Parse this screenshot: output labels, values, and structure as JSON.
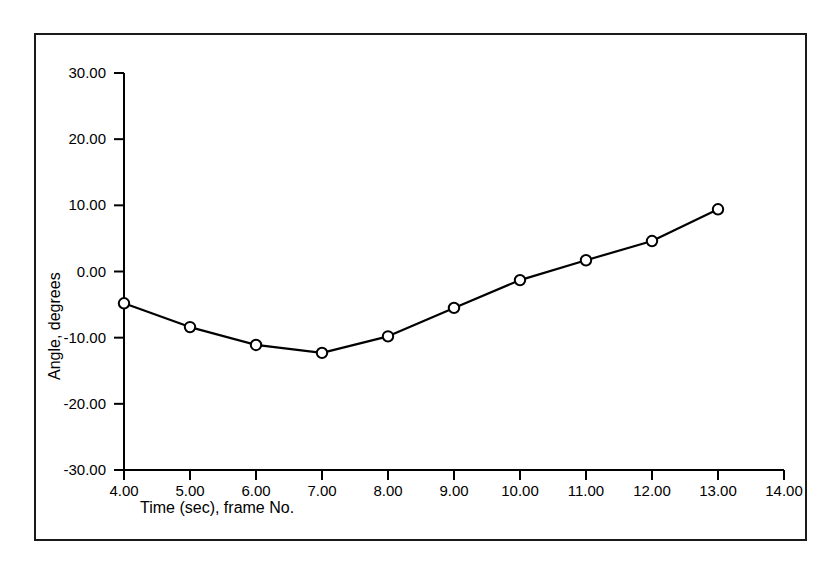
{
  "figure": {
    "border_color": "#1a1a1a",
    "background": "#ffffff",
    "line_color": "#000000",
    "marker_fill": "#ffffff"
  },
  "chart_data": {
    "type": "line",
    "title": "",
    "xlabel": "Time (sec), frame  No.",
    "ylabel": "Angle, degrees",
    "xlim": [
      4.0,
      14.0
    ],
    "ylim": [
      -30.0,
      30.0
    ],
    "grid": false,
    "legend": "none",
    "xticks": [
      4.0,
      5.0,
      6.0,
      7.0,
      8.0,
      9.0,
      10.0,
      11.0,
      12.0,
      13.0,
      14.0
    ],
    "xtick_labels": [
      "4.00",
      "5.00",
      "6.00",
      "7.00",
      "8.00",
      "9.00",
      "10.00",
      "11.00",
      "12.00",
      "13.00",
      "14.00"
    ],
    "yticks": [
      30.0,
      20.0,
      10.0,
      0.0,
      -10.0,
      -20.0,
      -30.0
    ],
    "ytick_labels": [
      "30.00",
      "20.00",
      "10.00",
      "0.00",
      "-10.00",
      "-20.00",
      "-30.00"
    ],
    "series": [
      {
        "name": "angle",
        "marker": "open-circle",
        "x": [
          4.0,
          5.0,
          6.0,
          7.0,
          8.0,
          9.0,
          10.0,
          11.0,
          12.0,
          13.0
        ],
        "values": [
          -4.8,
          -8.4,
          -11.1,
          -12.3,
          -9.8,
          -5.5,
          -1.3,
          1.7,
          4.6,
          9.4
        ]
      }
    ]
  }
}
